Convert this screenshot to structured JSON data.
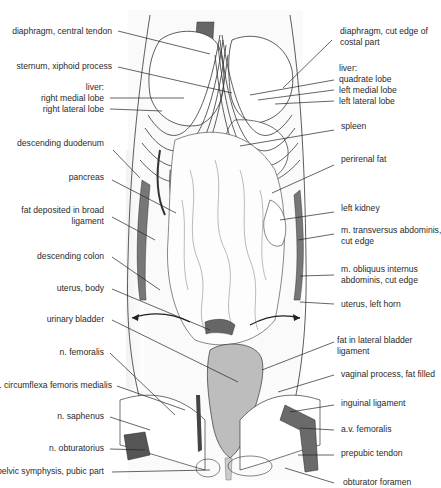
{
  "figure": {
    "colors": {
      "background": "#ffffff",
      "line": "#2a2a2a",
      "vessel_dark": "#555555",
      "vessel_mid": "#8a8a8a",
      "bladder": "#b8b8b8",
      "shading": "#e6e6e6"
    }
  },
  "labels_left": [
    {
      "lines": [
        "diaphragm, central tendon"
      ]
    },
    {
      "lines": [
        "sternum, xiphoid process"
      ]
    },
    {
      "lines": [
        "liver:",
        "right medial lobe",
        "right lateral lobe"
      ]
    },
    {
      "lines": [
        "descending duodenum"
      ]
    },
    {
      "lines": [
        "pancreas"
      ]
    },
    {
      "lines": [
        "fat deposited in broad",
        "ligament"
      ]
    },
    {
      "lines": [
        "descending colon"
      ]
    },
    {
      "lines": [
        "uterus, body"
      ]
    },
    {
      "lines": [
        "urinary bladder"
      ]
    },
    {
      "lines": [
        "n. femoralis"
      ]
    },
    {
      "lines": [
        "a. circumflexa femoris medialis"
      ]
    },
    {
      "lines": [
        "n. saphenus"
      ]
    },
    {
      "lines": [
        "n. obturatorius"
      ]
    },
    {
      "lines": [
        "pelvic symphysis, pubic part"
      ]
    }
  ],
  "labels_right": [
    {
      "lines": [
        "diaphragm, cut edge of",
        "costal part"
      ]
    },
    {
      "lines": [
        "liver:",
        "quadrate lobe",
        "left medial lobe",
        "left lateral lobe"
      ]
    },
    {
      "lines": [
        "spleen"
      ]
    },
    {
      "lines": [
        "perirenal fat"
      ]
    },
    {
      "lines": [
        "left kidney"
      ]
    },
    {
      "lines": [
        "m. transversus abdominis,",
        "cut edge"
      ]
    },
    {
      "lines": [
        "m. obliquus internus",
        "abdominis, cut edge"
      ]
    },
    {
      "lines": [
        "uterus, left horn"
      ]
    },
    {
      "lines": [
        "fat in lateral bladder",
        "ligament"
      ]
    },
    {
      "lines": [
        "vaginal process, fat filled"
      ]
    },
    {
      "lines": [
        "inguinal ligament"
      ]
    },
    {
      "lines": [
        "a.v. femoralis"
      ]
    },
    {
      "lines": [
        "prepubic tendon"
      ]
    },
    {
      "lines": [
        "obturator foramen"
      ]
    }
  ]
}
